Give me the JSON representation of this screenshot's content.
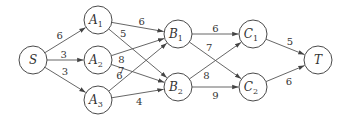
{
  "diagram": {
    "type": "directed-weighted-graph",
    "nodes": [
      {
        "id": "S",
        "base": "S",
        "sub": ""
      },
      {
        "id": "A1",
        "base": "A",
        "sub": "1"
      },
      {
        "id": "A2",
        "base": "A",
        "sub": "2"
      },
      {
        "id": "A3",
        "base": "A",
        "sub": "3"
      },
      {
        "id": "B1",
        "base": "B",
        "sub": "1"
      },
      {
        "id": "B2",
        "base": "B",
        "sub": "2"
      },
      {
        "id": "C1",
        "base": "C",
        "sub": "1"
      },
      {
        "id": "C2",
        "base": "C",
        "sub": "2"
      },
      {
        "id": "T",
        "base": "T",
        "sub": ""
      }
    ],
    "edges": [
      {
        "from": "S",
        "to": "A1",
        "weight": "6"
      },
      {
        "from": "S",
        "to": "A2",
        "weight": "3"
      },
      {
        "from": "S",
        "to": "A3",
        "weight": "3"
      },
      {
        "from": "A1",
        "to": "B1",
        "weight": "6"
      },
      {
        "from": "A1",
        "to": "B2",
        "weight": "5"
      },
      {
        "from": "A2",
        "to": "B1",
        "weight": "8"
      },
      {
        "from": "A2",
        "to": "B2",
        "weight": "6"
      },
      {
        "from": "A3",
        "to": "B1",
        "weight": "7"
      },
      {
        "from": "A3",
        "to": "B2",
        "weight": "4"
      },
      {
        "from": "B1",
        "to": "C1",
        "weight": "6"
      },
      {
        "from": "B1",
        "to": "C2",
        "weight": "7"
      },
      {
        "from": "B2",
        "to": "C1",
        "weight": "8"
      },
      {
        "from": "B2",
        "to": "C2",
        "weight": "9"
      },
      {
        "from": "C1",
        "to": "T",
        "weight": "5"
      },
      {
        "from": "C2",
        "to": "T",
        "weight": "6"
      }
    ]
  }
}
